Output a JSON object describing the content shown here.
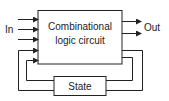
{
  "diagram": {
    "main_block": {
      "line1": "Combinational",
      "line2": "logic circuit"
    },
    "state_block": {
      "label": "State"
    },
    "input_label": "In",
    "output_label": "Out",
    "input_count": 3,
    "output_count": 2,
    "feedback_paths": 2
  },
  "colors": {
    "stroke": "#222222",
    "background": "#ffffff"
  }
}
